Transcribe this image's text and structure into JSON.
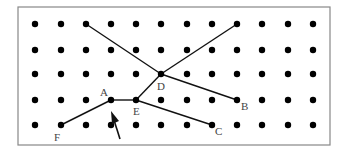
{
  "diagram": {
    "frame": {
      "x": 18,
      "y": 7,
      "width": 312,
      "height": 138,
      "stroke": "#888888"
    },
    "grid": {
      "columns": [
        35,
        61,
        86,
        111,
        136,
        161,
        187,
        212,
        237,
        262,
        288,
        313
      ],
      "rows": [
        24,
        50,
        74,
        100,
        125
      ],
      "dot_radius": 3.2,
      "dot_color": "#000000"
    },
    "points": {
      "A": {
        "x": 111,
        "y": 100,
        "label": "A",
        "lx": 100,
        "ly": 96
      },
      "B": {
        "x": 237,
        "y": 100,
        "label": "B",
        "lx": 241,
        "ly": 110
      },
      "C": {
        "x": 212,
        "y": 125,
        "label": "C",
        "lx": 215,
        "ly": 135
      },
      "D": {
        "x": 161,
        "y": 74,
        "label": "D",
        "lx": 157,
        "ly": 90
      },
      "E": {
        "x": 136,
        "y": 100,
        "label": "E",
        "lx": 133,
        "ly": 115
      },
      "F": {
        "x": 61,
        "y": 125,
        "label": "F",
        "lx": 54,
        "ly": 141
      }
    },
    "segments": [
      {
        "from": [
          86,
          24
        ],
        "to": [
          161,
          74
        ]
      },
      {
        "from": [
          161,
          74
        ],
        "to": [
          237,
          24
        ]
      },
      {
        "from": [
          161,
          74
        ],
        "to": [
          136,
          100
        ]
      },
      {
        "from": [
          161,
          74
        ],
        "to": [
          237,
          100
        ]
      },
      {
        "from": [
          111,
          100
        ],
        "to": [
          136,
          100
        ]
      },
      {
        "from": [
          136,
          100
        ],
        "to": [
          212,
          125
        ]
      },
      {
        "from": [
          61,
          125
        ],
        "to": [
          111,
          100
        ]
      }
    ],
    "arrow": {
      "tail": [
        120,
        139
      ],
      "head": [
        111,
        111
      ]
    }
  }
}
